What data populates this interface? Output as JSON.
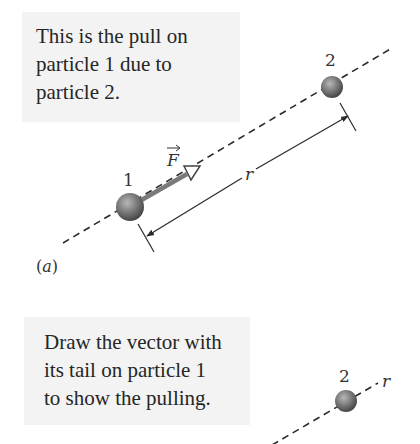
{
  "panel_a": {
    "callout_lines": [
      "This is the pull on",
      "particle 1 due to",
      "particle 2."
    ],
    "particle_1_label": "1",
    "particle_2_label": "2",
    "force_label": "F",
    "distance_label": "r",
    "panel_label": "(a)"
  },
  "panel_b": {
    "callout_lines": [
      "Draw the vector with",
      "its tail on particle 1",
      "to show the pulling."
    ],
    "particle_2_label": "2",
    "distance_label": "r"
  },
  "colors": {
    "callout_bg": "#f3f3f3",
    "particle": "#6e6e6e",
    "force_arrow": "#7a7a7a",
    "line": "#2a2a2a"
  }
}
